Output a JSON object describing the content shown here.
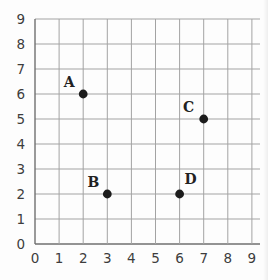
{
  "chart_data": {
    "type": "scatter",
    "title": "",
    "xlabel": "",
    "ylabel": "",
    "xlim": [
      0,
      9
    ],
    "ylim": [
      0,
      9
    ],
    "grid": true,
    "x_ticks": [
      0,
      1,
      2,
      3,
      4,
      5,
      6,
      7,
      8,
      9
    ],
    "y_ticks": [
      0,
      1,
      2,
      3,
      4,
      5,
      6,
      7,
      8,
      9
    ],
    "points": [
      {
        "label": "A",
        "x": 2,
        "y": 6,
        "label_offset": [
          -14,
          -12
        ]
      },
      {
        "label": "B",
        "x": 3,
        "y": 2,
        "label_offset": [
          -14,
          -12
        ]
      },
      {
        "label": "C",
        "x": 7,
        "y": 5,
        "label_offset": [
          -15,
          -12
        ]
      },
      {
        "label": "D",
        "x": 6,
        "y": 2,
        "label_offset": [
          11,
          -15
        ]
      }
    ],
    "colors": {
      "background": "#fdfdfd",
      "grid": "#a3a3a3",
      "axis": "#6f6f6f",
      "point": "#1c1c1c",
      "tick_text": "#3d3d3d",
      "label_text": "#222222"
    }
  }
}
